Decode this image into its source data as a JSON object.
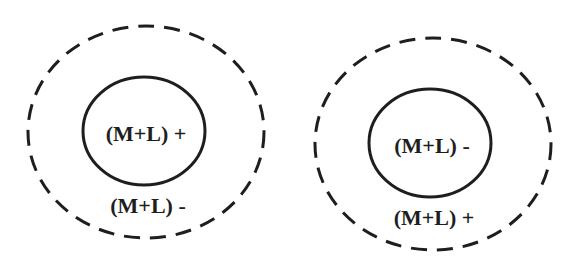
{
  "diagrams": [
    {
      "inner_label": "(M+L) +",
      "outer_label": "(M+L) -"
    },
    {
      "inner_label": "(M+L) -",
      "outer_label": "(M+L) +"
    }
  ],
  "colors": {
    "stroke": "#1e1e1e",
    "background": "#ffffff"
  }
}
